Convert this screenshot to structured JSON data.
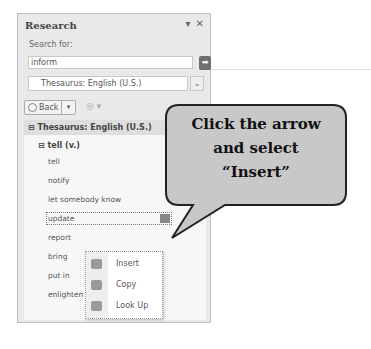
{
  "panel": {
    "title": "Research",
    "controls": {
      "dropdown_icon": "▾",
      "close_icon": "✕"
    },
    "search_label": "Search for:",
    "search_value": "inform",
    "go_icon": "➡",
    "source_value": "Thesaurus: English (U.S.)",
    "source_arrow": "⌄",
    "back_label": "Back",
    "back_dd": "▾",
    "forward_icon": "◎ ▾"
  },
  "results": {
    "section_title": "⊟ Thesaurus: English (U.S.)",
    "group_title": "⊟ tell (v.)",
    "items": [
      "tell",
      "notify",
      "let somebody know",
      "update",
      "report",
      "bring",
      "put in",
      "enlighten"
    ]
  },
  "context_menu": {
    "items": [
      {
        "label": "Insert",
        "icon": "insert-icon"
      },
      {
        "label": "Copy",
        "icon": "copy-icon"
      },
      {
        "label": "Look Up",
        "icon": "look-up-icon"
      }
    ]
  },
  "callout": {
    "line1": "Click the arrow",
    "line2": "and select",
    "line3": "“Insert”"
  },
  "colors": {
    "panel_bg": "#e9e9e9",
    "callout_bg": "#c8c8c8",
    "callout_border": "#222222"
  }
}
